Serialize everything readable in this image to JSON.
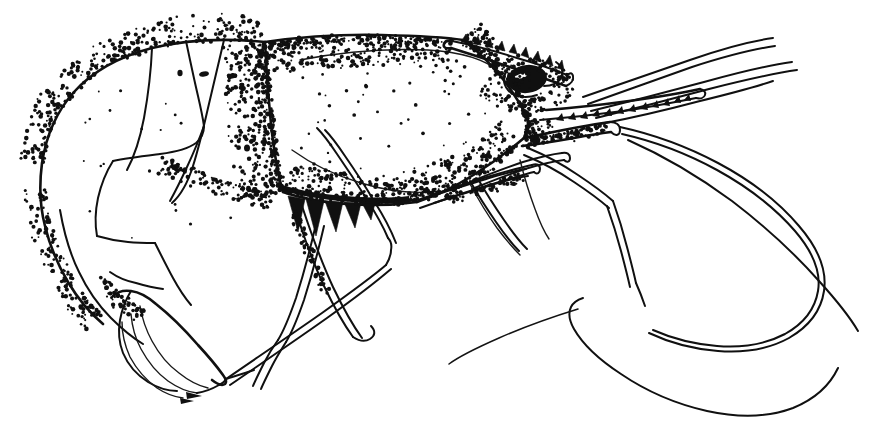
{
  "figure": {
    "domain": "scientific-illustration",
    "view": "lateral, left side, head to the right",
    "technique": "pen-and-ink line drawing with stipple shading",
    "background_color": "#ffffff",
    "ink_color": "#101010",
    "width": 883,
    "height": 448,
    "has_text_labels": false,
    "caption": ""
  },
  "anatomy": {
    "parts": [
      {
        "id": "carapace",
        "label": "Carapace",
        "interactable": false
      },
      {
        "id": "rostrum",
        "label": "Rostrum",
        "interactable": false
      },
      {
        "id": "rostral-teeth",
        "label": "Dorsal rostral teeth",
        "count": 9,
        "interactable": false
      },
      {
        "id": "eye",
        "label": "Compound eye with stalk",
        "interactable": false
      },
      {
        "id": "antennular-flagella",
        "label": "Antennular flagella",
        "count": 3,
        "interactable": false
      },
      {
        "id": "antennal-scale",
        "label": "Antennal scale (scaphocerite)",
        "interactable": false
      },
      {
        "id": "antennal-flagellum",
        "label": "Antennal flagellum",
        "interactable": false
      },
      {
        "id": "third-maxilliped",
        "label": "Third maxilliped",
        "interactable": false
      },
      {
        "id": "pereiopods",
        "label": "Pereiopods (walking legs)",
        "count": 5,
        "interactable": false
      },
      {
        "id": "branchiostegite-spines",
        "label": "Dark branchial spines",
        "count": 5,
        "interactable": false
      },
      {
        "id": "abdomen",
        "label": "Abdominal somites with pleura",
        "count": 6,
        "interactable": false
      },
      {
        "id": "telson",
        "label": "Telson",
        "interactable": false
      },
      {
        "id": "uropods",
        "label": "Uropods",
        "interactable": false
      },
      {
        "id": "pleopods",
        "label": "Pleopods",
        "interactable": false
      }
    ]
  },
  "rendering": {
    "stipple_seed": 20240611,
    "stipple_density_carapace": 1400,
    "stipple_density_abdomen": 620,
    "line_weight_outline": 2.6,
    "line_weight_detail": 1.4
  }
}
